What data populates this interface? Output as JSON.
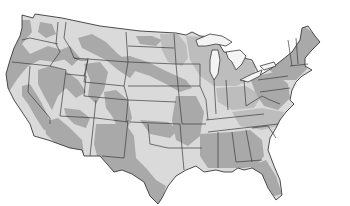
{
  "map": {
    "subject": "Contiguous United States",
    "style": "grayscale shaded regions with state borders",
    "legend": null,
    "labels": [],
    "colors": {
      "background": "#ffffff",
      "light_zone": "#dadada",
      "dark_zone": "#a9a9a9",
      "mid_zone": "#bdbdbd",
      "state_border": "#3a3a3a",
      "lakes": "#f4f4f4"
    },
    "zones": [
      {
        "id": "pacific-northwest-coast",
        "shade": "dark_zone"
      },
      {
        "id": "california-central",
        "shade": "dark_zone"
      },
      {
        "id": "great-basin-north",
        "shade": "dark_zone"
      },
      {
        "id": "montana-central-band",
        "shade": "dark_zone"
      },
      {
        "id": "plains-diagonal-band",
        "shade": "dark_zone"
      },
      {
        "id": "southwest-desert",
        "shade": "dark_zone"
      },
      {
        "id": "texas-west-and-south",
        "shade": "dark_zone"
      },
      {
        "id": "deep-south",
        "shade": "dark_zone"
      },
      {
        "id": "northeast",
        "shade": "dark_zone"
      },
      {
        "id": "great-lakes-upper-midwest",
        "shade": "mid_zone"
      },
      {
        "id": "remaining-interior",
        "shade": "light_zone"
      }
    ]
  }
}
